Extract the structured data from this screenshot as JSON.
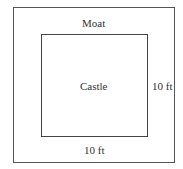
{
  "diagram": {
    "outer_label": "Moat",
    "inner_label": "Castle",
    "right_dimension": "10 ft",
    "bottom_dimension": "10 ft",
    "colors": {
      "line": "#555555",
      "text": "#333333",
      "background": "#ffffff"
    }
  }
}
